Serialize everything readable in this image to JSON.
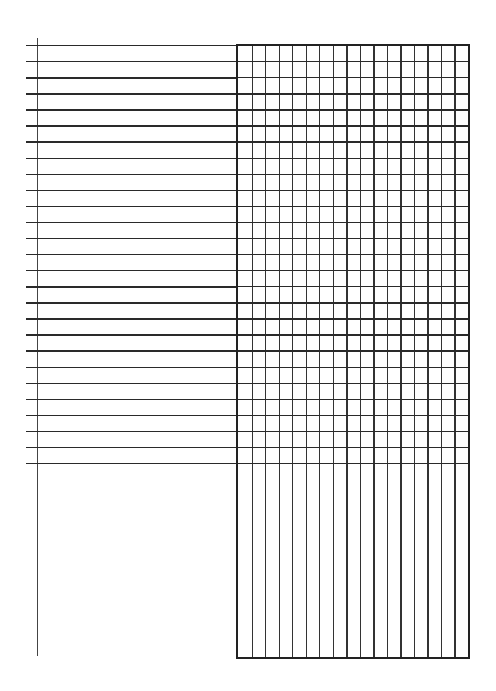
{
  "page": {
    "type": "blank ruled form with grid",
    "left_section": {
      "ruled_lines": 27,
      "first_line_y": 45,
      "last_line_y": 463
    },
    "grid_section": {
      "columns": 17,
      "ruled_rows": 26,
      "unruled_lower_area": true
    },
    "colors": {
      "ink": "#2a2a2a",
      "paper": "#ffffff"
    }
  }
}
